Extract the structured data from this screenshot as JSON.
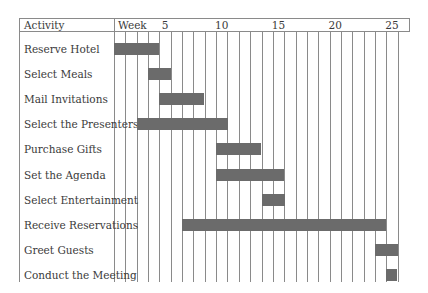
{
  "chart_data": {
    "type": "gantt",
    "title": "",
    "header": {
      "activity_label": "Activity",
      "timeline_label": "Week"
    },
    "xlabel": "Week",
    "ylabel": "Activity",
    "x_range": [
      1,
      26
    ],
    "tick_labels": [
      {
        "week": 5,
        "label": "5"
      },
      {
        "week": 10,
        "label": "10"
      },
      {
        "week": 15,
        "label": "15"
      },
      {
        "week": 20,
        "label": "20"
      },
      {
        "week": 25,
        "label": "25"
      }
    ],
    "grid": true,
    "tasks": [
      {
        "name": "Reserve Hotel",
        "start_week": 1,
        "end_week": 4
      },
      {
        "name": "Select Meals",
        "start_week": 4,
        "end_week": 5
      },
      {
        "name": "Mail Invitations",
        "start_week": 5,
        "end_week": 8
      },
      {
        "name": "Select the Presenters",
        "start_week": 3,
        "end_week": 10
      },
      {
        "name": "Purchase Gifts",
        "start_week": 10,
        "end_week": 13
      },
      {
        "name": "Set the Agenda",
        "start_week": 10,
        "end_week": 15
      },
      {
        "name": "Select Entertainment",
        "start_week": 14,
        "end_week": 15
      },
      {
        "name": "Receive Reservations",
        "start_week": 7,
        "end_week": 24
      },
      {
        "name": "Greet Guests",
        "start_week": 24,
        "end_week": 25
      },
      {
        "name": "Conduct the Meeting",
        "start_week": 25,
        "end_week": 25
      }
    ],
    "colors": {
      "bar": "#6b6b6b",
      "grid": "#8a8a8a",
      "text": "#3a3a3a"
    }
  }
}
